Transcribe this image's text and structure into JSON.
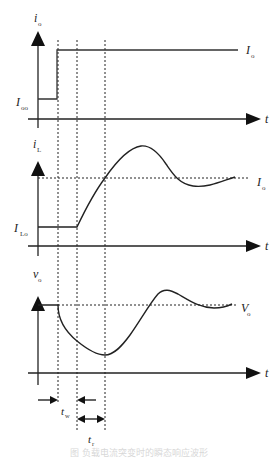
{
  "figure": {
    "type": "waveform-timing-diagram",
    "panels": [
      {
        "id": "io",
        "y_label": "i",
        "y_label_sub": "o",
        "left_level_label": "I",
        "left_level_sub": "oo",
        "right_level_label": "I",
        "right_level_sub": "o",
        "x_label": "t",
        "description": "Load current step from I_oo to I_o"
      },
      {
        "id": "iL",
        "y_label": "i",
        "y_label_sub": "L",
        "left_level_label": "I",
        "left_level_sub": "Lo",
        "right_level_label": "I",
        "right_level_sub": "o",
        "x_label": "t",
        "description": "Inductor current rises with delay, overshoots, settles to I_o"
      },
      {
        "id": "vo",
        "y_label": "v",
        "y_label_sub": "o",
        "right_level_label": "V",
        "right_level_sub": "o",
        "x_label": "t",
        "description": "Output voltage dips, recovers, overshoots, settles to V_o"
      }
    ],
    "intervals": [
      {
        "label": "t",
        "sub": "w",
        "description": "delay interval"
      },
      {
        "label": "t",
        "sub": "r",
        "description": "rise interval"
      }
    ],
    "caption": "图 负载电流突变时的瞬态响应波形"
  },
  "colors": {
    "line": "#222222",
    "background": "#ffffff",
    "caption": "#d8d8d8"
  }
}
